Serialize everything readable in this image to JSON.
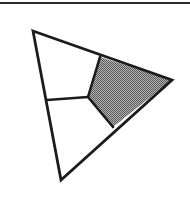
{
  "figure": {
    "kind": "geometric-diagram",
    "canvas": {
      "width": 190,
      "height": 203,
      "background": "#ffffff"
    },
    "colors": {
      "stroke": "#1c1c1c",
      "shaded_fill": "#8a8a8a",
      "unshaded_fill": "#ffffff",
      "rule": "#2b2b2b"
    },
    "stroke_width": 2.6,
    "page_rule": {
      "name": "top-horizontal-rule",
      "x1": 0,
      "y1": 3,
      "x2": 190,
      "y2": 3,
      "thickness": 2.2
    },
    "outer_triangle": {
      "label": "outer-triangle",
      "points": "33,31 172,80 61,180",
      "vertices": [
        {
          "name": "apex-top-left",
          "x": 33,
          "y": 31
        },
        {
          "name": "vertex-right",
          "x": 172,
          "y": 80
        },
        {
          "name": "vertex-bottom",
          "x": 61,
          "y": 180
        }
      ]
    },
    "interior_points": [
      {
        "name": "top-edge-split",
        "x": 100,
        "y": 57
      },
      {
        "name": "center-junction",
        "x": 88,
        "y": 97
      },
      {
        "name": "left-edge-split",
        "x": 47,
        "y": 100
      },
      {
        "name": "hypotenuse-split",
        "x": 113,
        "y": 127
      }
    ],
    "regions": [
      {
        "name": "region-upper-left",
        "shaded": false,
        "fill": "#ffffff",
        "points": "33,31 100,57 88,97 47,100"
      },
      {
        "name": "region-shaded-right",
        "shaded": true,
        "fill": "#8a8a8a",
        "points": "100,57 172,80 113,127 88,97"
      },
      {
        "name": "region-lower-left",
        "shaded": false,
        "fill": "#ffffff",
        "points": "47,100 88,97 113,127 61,180"
      }
    ],
    "interior_segments": [
      {
        "name": "segment-top-to-center",
        "x1": 100,
        "y1": 57,
        "x2": 88,
        "y2": 97
      },
      {
        "name": "segment-center-to-left",
        "x1": 88,
        "y1": 97,
        "x2": 47,
        "y2": 100
      },
      {
        "name": "segment-center-to-hypotenuse",
        "x1": 88,
        "y1": 97,
        "x2": 113,
        "y2": 127
      }
    ]
  }
}
